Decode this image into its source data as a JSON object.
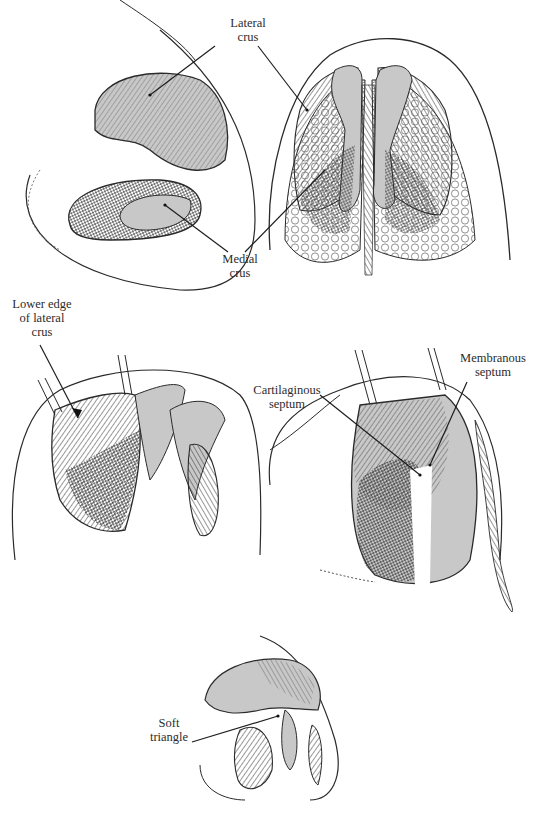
{
  "figure": {
    "type": "anatomical illustration",
    "palette": {
      "ink": "#2a2a2a",
      "cartilage_fill": "#c8c8c8",
      "background": "#ffffff"
    }
  },
  "panels": [
    {
      "id": "oblique-view",
      "position": "top-left"
    },
    {
      "id": "basal-view",
      "position": "top-right"
    },
    {
      "id": "retracted-lateral-crus-view",
      "position": "middle-left"
    },
    {
      "id": "septum-view",
      "position": "middle-right"
    },
    {
      "id": "soft-triangle-view",
      "position": "bottom-center"
    }
  ],
  "labels": {
    "lateral_crus": {
      "line1": "Lateral",
      "line2": "crus"
    },
    "medial_crus": {
      "line1": "Medial",
      "line2": "crus"
    },
    "lower_edge": {
      "line1": "Lower edge",
      "line2": "of lateral",
      "line3": "crus"
    },
    "cartilaginous_septum": {
      "line1": "Cartilaginous",
      "line2": "septum"
    },
    "membranous_septum": {
      "line1": "Membranous",
      "line2": "septum"
    },
    "soft_triangle": {
      "line1": "Soft",
      "line2": "triangle"
    }
  }
}
